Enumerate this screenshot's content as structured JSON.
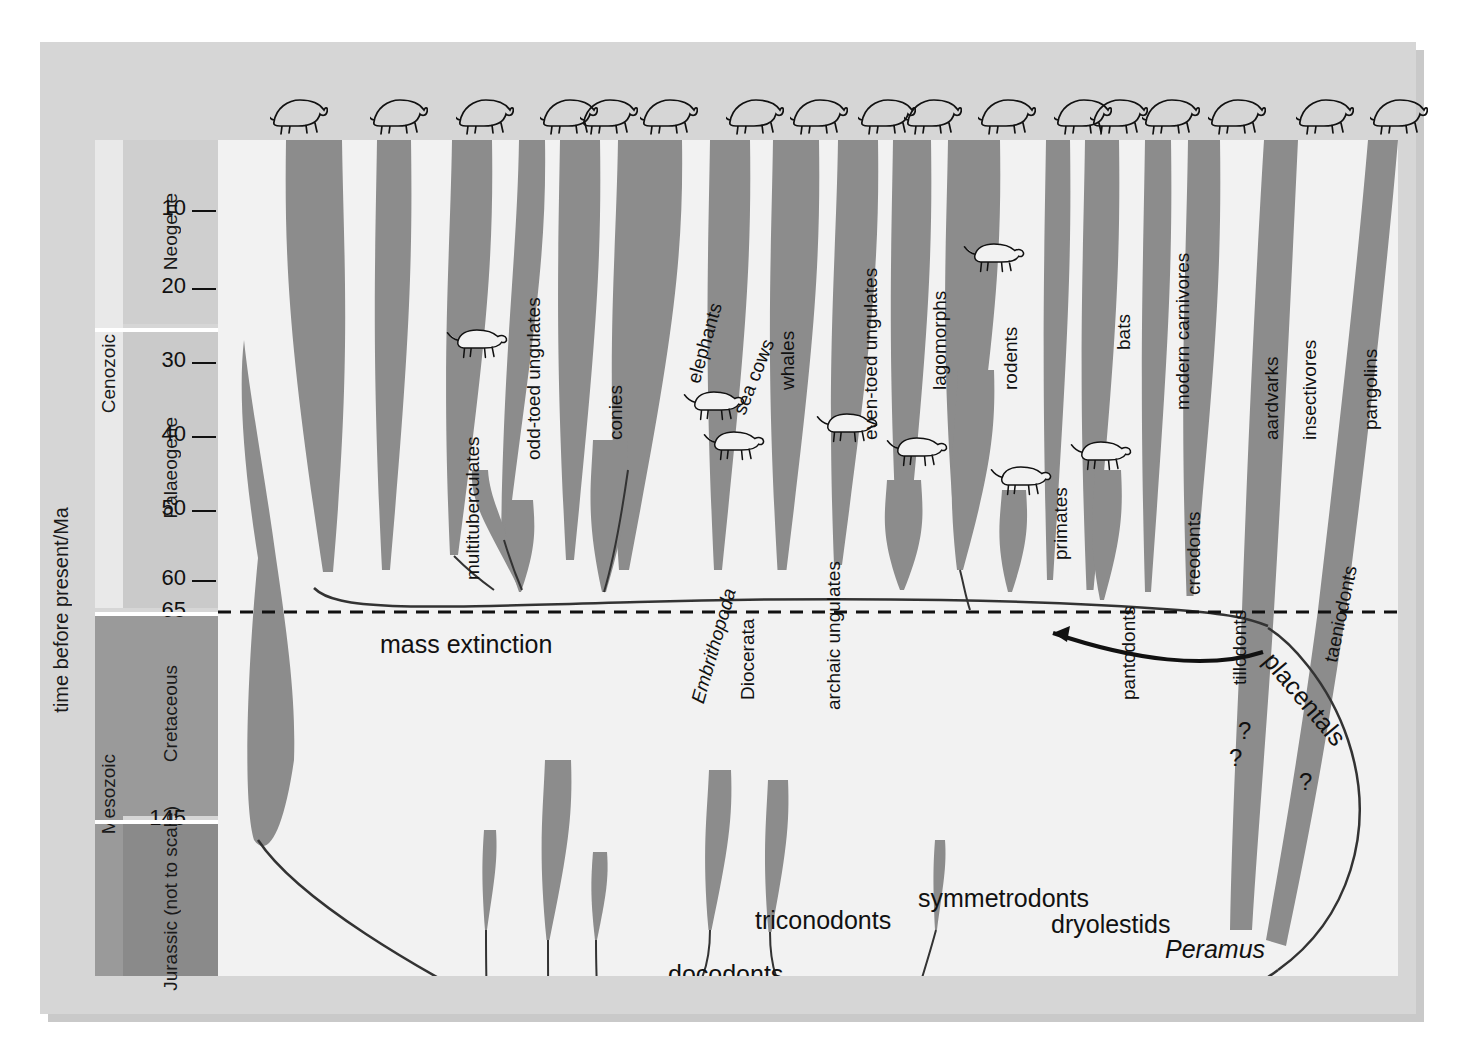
{
  "figure": {
    "axis_title": "time before present/Ma",
    "mass_extinction_label": "mass extinction",
    "placentals_label": "placentals"
  },
  "eras": [
    {
      "name": "Cenozoic",
      "top": 0,
      "height": 468
    },
    {
      "name": "Mesozoic",
      "top": 472,
      "height": 364
    }
  ],
  "periods": [
    {
      "name": "Neogene",
      "top": 0,
      "height": 184,
      "shade": "#cfcfcf"
    },
    {
      "name": "Palaeogene",
      "top": 188,
      "height": 280,
      "shade": "#cacaca"
    },
    {
      "name": "Cretaceous",
      "top": 472,
      "height": 204,
      "shade": "#9a9a9a"
    },
    {
      "name": "Jurassic (not to scale)",
      "top": 680,
      "height": 156,
      "shade": "#8a8a8a"
    }
  ],
  "ticks": [
    {
      "value": "10",
      "y": 70
    },
    {
      "value": "20",
      "y": 148
    },
    {
      "value": "30",
      "y": 222
    },
    {
      "value": "40",
      "y": 296
    },
    {
      "value": "50",
      "y": 370
    },
    {
      "value": "60",
      "y": 440
    },
    {
      "value": "65",
      "y": 472
    },
    {
      "value": "145",
      "y": 680
    }
  ],
  "chart_data": {
    "type": "diagram",
    "ylabel": "time before present/Ma",
    "ylim": [
      0,
      200
    ],
    "mass_extinction_Ma": 65,
    "clades": [
      {
        "label": "multituberculates",
        "x": 245,
        "y": 440,
        "rot": -90,
        "extinct": true
      },
      {
        "label": "odd-toed ungulates",
        "x": 306,
        "y": 320,
        "rot": -90,
        "extinct": false
      },
      {
        "label": "conies",
        "x": 388,
        "y": 300,
        "rot": -90,
        "extinct": false
      },
      {
        "label": "elephants",
        "x": 466,
        "y": 240,
        "rot": -74,
        "extinct": false
      },
      {
        "label": "sea cows",
        "x": 512,
        "y": 270,
        "rot": -68,
        "extinct": false
      },
      {
        "label": "Embrithopoda",
        "x": 470,
        "y": 560,
        "rot": -74,
        "italic": true,
        "extinct": true
      },
      {
        "label": "Diocerata",
        "x": 520,
        "y": 560,
        "rot": -90,
        "extinct": true
      },
      {
        "label": "whales",
        "x": 560,
        "y": 250,
        "rot": -90,
        "extinct": false
      },
      {
        "label": "archaic ungulates",
        "x": 606,
        "y": 570,
        "rot": -90,
        "extinct": true
      },
      {
        "label": "even-toed ungulates",
        "x": 643,
        "y": 300,
        "rot": -90,
        "extinct": false
      },
      {
        "label": "lagomorphs",
        "x": 712,
        "y": 250,
        "rot": -90,
        "extinct": false
      },
      {
        "label": "rodents",
        "x": 783,
        "y": 250,
        "rot": -90,
        "extinct": false
      },
      {
        "label": "primates",
        "x": 833,
        "y": 420,
        "rot": -90,
        "extinct": false
      },
      {
        "label": "bats",
        "x": 896,
        "y": 210,
        "rot": -90,
        "extinct": false
      },
      {
        "label": "pantodonts",
        "x": 901,
        "y": 560,
        "rot": -90,
        "extinct": true
      },
      {
        "label": "modern carnivores",
        "x": 955,
        "y": 270,
        "rot": -90,
        "extinct": false
      },
      {
        "label": "creodonts",
        "x": 966,
        "y": 455,
        "rot": -90,
        "extinct": true
      },
      {
        "label": "tillodonts",
        "x": 1012,
        "y": 545,
        "rot": -90,
        "extinct": true
      },
      {
        "label": "aardvarks",
        "x": 1044,
        "y": 300,
        "rot": -90,
        "extinct": false
      },
      {
        "label": "insectivores",
        "x": 1082,
        "y": 300,
        "rot": -90,
        "extinct": false
      },
      {
        "label": "taeniodonts",
        "x": 1103,
        "y": 520,
        "rot": -78,
        "extinct": true
      },
      {
        "label": "pangolins",
        "x": 1143,
        "y": 290,
        "rot": -90,
        "extinct": false
      },
      {
        "label": "edentates",
        "x": 1183,
        "y": 290,
        "rot": -90,
        "extinct": false
      },
      {
        "label": "marsupials",
        "x": 1281,
        "y": 400,
        "rot": -78,
        "extinct": false
      },
      {
        "label": "monotremes",
        "x": 1372,
        "y": 290,
        "rot": -74,
        "extinct": false
      },
      {
        "label": "docodonts",
        "x": 450,
        "y": 822,
        "rot": 0,
        "extinct": true
      },
      {
        "label": "triconodonts",
        "x": 537,
        "y": 768,
        "rot": 0,
        "extinct": true
      },
      {
        "label": "morganucodonts",
        "x": 612,
        "y": 872,
        "rot": 0,
        "extinct": true
      },
      {
        "label": "symmetrodonts",
        "x": 700,
        "y": 746,
        "rot": 0,
        "extinct": true
      },
      {
        "label": "dryolestids",
        "x": 833,
        "y": 772,
        "rot": 0,
        "extinct": true
      },
      {
        "label": "Peramus",
        "x": 947,
        "y": 797,
        "rot": 0,
        "italic": true,
        "extinct": true
      }
    ],
    "uncertainty_marks": [
      {
        "label": "?",
        "x": 711,
        "y": 874
      },
      {
        "label": "?",
        "x": 1020,
        "y": 577
      },
      {
        "label": "?",
        "x": 1011,
        "y": 604
      },
      {
        "label": "?",
        "x": 1081,
        "y": 628
      }
    ]
  },
  "top_icons": [
    {
      "name": "rhinoceros-icon",
      "x": 52
    },
    {
      "name": "hyrax-icon",
      "x": 152
    },
    {
      "name": "elephant-icon",
      "x": 238
    },
    {
      "name": "sea-cow-icon",
      "x": 322
    },
    {
      "name": "whale-icon",
      "x": 362
    },
    {
      "name": "bison-icon",
      "x": 422
    },
    {
      "name": "rabbit-icon",
      "x": 508
    },
    {
      "name": "mouse-icon",
      "x": 572
    },
    {
      "name": "gorilla-icon",
      "x": 640
    },
    {
      "name": "bat-icon",
      "x": 686
    },
    {
      "name": "cat-icon",
      "x": 760
    },
    {
      "name": "shrew-icon",
      "x": 836
    },
    {
      "name": "aardvark-icon",
      "x": 872
    },
    {
      "name": "pangolin-icon",
      "x": 924
    },
    {
      "name": "armadillo-icon",
      "x": 990
    },
    {
      "name": "kangaroo-icon",
      "x": 1078
    },
    {
      "name": "echidna-icon",
      "x": 1152
    }
  ],
  "fossil_icons": [
    {
      "name": "creodont-fossil-icon",
      "x": 238,
      "y": 188
    },
    {
      "name": "uintathere-fossil-icon",
      "x": 475,
      "y": 250
    },
    {
      "name": "dinocerate-fossil-icon",
      "x": 495,
      "y": 290
    },
    {
      "name": "archaic-ungulate-fossil-icon",
      "x": 608,
      "y": 272
    },
    {
      "name": "pantodont-fossil-icon",
      "x": 678,
      "y": 296
    },
    {
      "name": "small-carnivore-fossil-icon",
      "x": 755,
      "y": 102
    },
    {
      "name": "tillodont-fossil-icon",
      "x": 782,
      "y": 325
    },
    {
      "name": "taeniodont-fossil-icon",
      "x": 862,
      "y": 300
    }
  ],
  "colors": {
    "plate": "#d6d6d6",
    "plot_bg": "#f2f2f2",
    "ribbon": "#8c8c8c",
    "neogene": "#cfcfcf",
    "palaeogene": "#cacaca",
    "cretaceous": "#9a9a9a",
    "jurassic": "#8a8a8a",
    "ink": "#111111"
  }
}
